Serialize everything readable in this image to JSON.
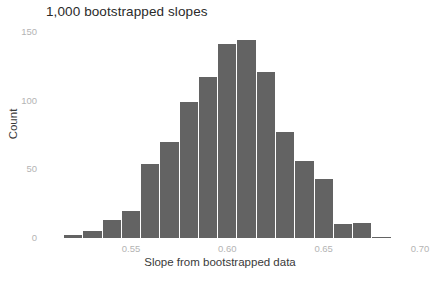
{
  "chart_data": {
    "type": "bar",
    "title": "1,000 bootstrapped slopes",
    "xlabel": "Slope from bootstrapped data",
    "ylabel": "Count",
    "grid": false,
    "legend": null,
    "bar_color": "#636363",
    "tick_color": "#b4b4b4",
    "bin_width": 0.01,
    "xlim": [
      0.508,
      0.71
    ],
    "ylim": [
      0,
      155
    ],
    "xticks": [
      0.55,
      0.6,
      0.65,
      0.7
    ],
    "xtick_labels": [
      "0.55",
      "0.60",
      "0.65",
      "0.70"
    ],
    "yticks": [
      0,
      50,
      100,
      150
    ],
    "ytick_labels": [
      "0",
      "50",
      "100",
      "150"
    ],
    "bin_starts": [
      0.515,
      0.525,
      0.535,
      0.545,
      0.555,
      0.565,
      0.575,
      0.585,
      0.595,
      0.605,
      0.615,
      0.625,
      0.635,
      0.645,
      0.655,
      0.665,
      0.675
    ],
    "categories": [
      "0.515-0.525",
      "0.525-0.535",
      "0.535-0.545",
      "0.545-0.555",
      "0.555-0.565",
      "0.565-0.575",
      "0.575-0.585",
      "0.585-0.595",
      "0.595-0.605",
      "0.605-0.615",
      "0.615-0.625",
      "0.625-0.635",
      "0.635-0.645",
      "0.645-0.655",
      "0.655-0.665",
      "0.665-0.675",
      "0.675-0.685"
    ],
    "values": [
      2,
      5,
      13,
      20,
      54,
      70,
      99,
      117,
      141,
      144,
      121,
      77,
      56,
      43,
      10,
      11,
      1
    ]
  }
}
